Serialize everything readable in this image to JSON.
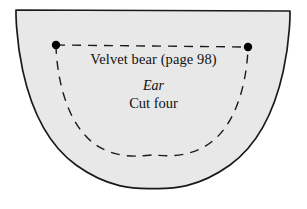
{
  "figure": {
    "kind": "sewing-pattern-piece",
    "shape": "half-ellipse-dome",
    "colors": {
      "background": "#ffffff",
      "piece_fill": "#e8e8e8",
      "outline": "#1a1a1a",
      "dashed_line": "#1a1a1a",
      "dot": "#000000",
      "text": "#111111"
    }
  },
  "labels": {
    "title": "Velvet bear (page 98)",
    "part": "Ear",
    "instruction": "Cut four"
  },
  "markings": {
    "dots": [
      {
        "name": "left-dot",
        "x": 56,
        "y": 45
      },
      {
        "name": "right-dot",
        "x": 248,
        "y": 47
      }
    ],
    "straight_dashed_line": {
      "from": {
        "x": 56,
        "y": 45
      },
      "to": {
        "x": 248,
        "y": 47
      }
    },
    "dashed_arc": {
      "from": {
        "x": 56,
        "y": 45
      },
      "to": {
        "x": 248,
        "y": 47
      },
      "lowest_point": {
        "x": 152,
        "y": 155
      }
    }
  },
  "outline": {
    "top_left": {
      "x": 16,
      "y": 10
    },
    "top_right": {
      "x": 290,
      "y": 11
    },
    "bottom_center": {
      "x": 153,
      "y": 188
    }
  }
}
